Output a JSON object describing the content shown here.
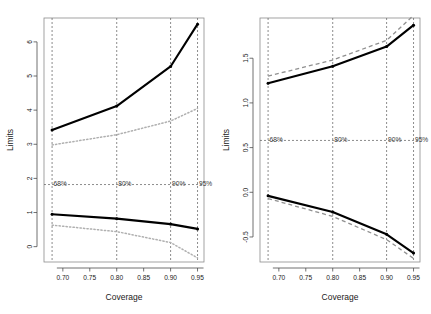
{
  "figure": {
    "panel_count": 2
  },
  "chart_data": [
    {
      "type": "line",
      "panel": "left",
      "title": "",
      "xlabel": "Coverage",
      "ylabel": "Limits",
      "xlim": [
        0.665,
        0.962
      ],
      "ylim": [
        -0.45,
        6.7
      ],
      "xticks": [
        0.7,
        0.75,
        0.8,
        0.85,
        0.9,
        0.95
      ],
      "xticklabels": [
        "0.70",
        "0.75",
        "0.80",
        "0.85",
        "0.90",
        "0.95"
      ],
      "yticks": [
        0,
        1,
        2,
        3,
        4,
        5,
        6
      ],
      "yticklabels": [
        "0",
        "1",
        "2",
        "3",
        "4",
        "5",
        "6"
      ],
      "grid": false,
      "legend": "none",
      "x": [
        0.68,
        0.8,
        0.9,
        0.95
      ],
      "series": [
        {
          "name": "upper-limit-solid",
          "style": "solid",
          "color": "#000000",
          "values": [
            3.42,
            4.12,
            5.28,
            6.52
          ]
        },
        {
          "name": "upper-limit-dotted",
          "style": "dotted",
          "color": "#b0b0b0",
          "values": [
            2.98,
            3.28,
            3.68,
            4.05
          ]
        },
        {
          "name": "lower-limit-solid",
          "style": "solid",
          "color": "#000000",
          "values": [
            0.95,
            0.82,
            0.66,
            0.52
          ]
        },
        {
          "name": "lower-limit-dotted",
          "style": "dotted",
          "color": "#b0b0b0",
          "values": [
            0.63,
            0.44,
            0.12,
            -0.33
          ]
        }
      ],
      "reference_lines": {
        "horizontal": [
          1.82
        ],
        "vertical": [
          0.68,
          0.8,
          0.9,
          0.95
        ],
        "vertical_labels": [
          "68%",
          "80%",
          "90%",
          "95%"
        ]
      }
    },
    {
      "type": "line",
      "panel": "right",
      "title": "",
      "xlabel": "Coverage",
      "ylabel": "Limits",
      "xlim": [
        0.665,
        0.962
      ],
      "ylim": [
        -0.78,
        1.95
      ],
      "xticks": [
        0.7,
        0.75,
        0.8,
        0.85,
        0.9,
        0.95
      ],
      "xticklabels": [
        "0.70",
        "0.75",
        "0.80",
        "0.85",
        "0.90",
        "0.95"
      ],
      "yticks": [
        -0.5,
        0.0,
        0.5,
        1.0,
        1.5
      ],
      "yticklabels": [
        "-0.5",
        "0.0",
        "0.5",
        "1.0",
        "1.5"
      ],
      "grid": false,
      "legend": "none",
      "x": [
        0.68,
        0.8,
        0.9,
        0.95
      ],
      "series": [
        {
          "name": "upper-limit-solid",
          "style": "solid",
          "color": "#000000",
          "values": [
            1.22,
            1.41,
            1.63,
            1.87
          ]
        },
        {
          "name": "upper-limit-dashed",
          "style": "dashed",
          "color": "#909090",
          "values": [
            1.3,
            1.48,
            1.7,
            1.98
          ]
        },
        {
          "name": "lower-limit-solid",
          "style": "solid",
          "color": "#000000",
          "values": [
            -0.04,
            -0.22,
            -0.47,
            -0.68
          ]
        },
        {
          "name": "lower-limit-dashed",
          "style": "dashed",
          "color": "#909090",
          "values": [
            -0.07,
            -0.27,
            -0.53,
            -0.74
          ]
        }
      ],
      "reference_lines": {
        "horizontal": [
          0.58
        ],
        "vertical": [
          0.68,
          0.8,
          0.9,
          0.95
        ],
        "vertical_labels": [
          "68%",
          "80%",
          "90%",
          "95%"
        ]
      }
    }
  ]
}
